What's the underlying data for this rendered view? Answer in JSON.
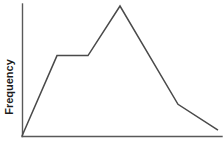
{
  "figure": {
    "background_color": "#ffffff",
    "axis_color": "#595959",
    "line_color": "#4a4a4a",
    "y_axis_title": "Frequency",
    "x_axis_title": ""
  },
  "chart_data": {
    "type": "line",
    "title": "",
    "subtitle": "",
    "xlabel": "",
    "ylabel": "Frequency",
    "grid": false,
    "legend": false,
    "legend_position": "none",
    "tick_labels_x": [],
    "tick_labels_y": [],
    "xlim": [
      0,
      100
    ],
    "ylim": [
      0,
      100
    ],
    "annotations": [],
    "series": [
      {
        "name": "frequency",
        "color": "#4a4a4a",
        "x": [
          0,
          17.5,
          33,
          49,
          78,
          98
        ],
        "y": [
          0,
          61.4,
          61.4,
          99.2,
          24.2,
          4.5
        ],
        "vertex_labels": [
          "origin",
          "plateau-start",
          "plateau-end",
          "peak",
          "knee",
          "end"
        ]
      }
    ]
  }
}
